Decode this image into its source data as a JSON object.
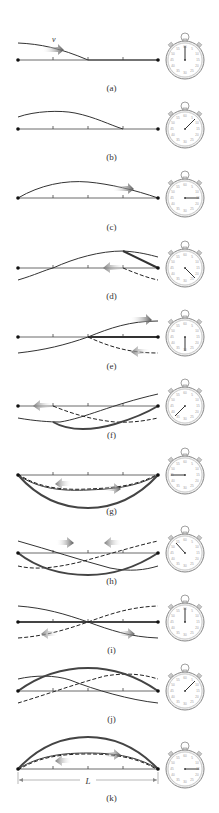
{
  "figure": {
    "velocity_label": "v",
    "length_label": "L",
    "colors": {
      "string": "#3a3a3a",
      "resultant": "#555555",
      "arrow_light": "#b0b0b0",
      "arrow_dark": "#5a5a5a"
    },
    "panels": [
      {
        "id": "a",
        "label": "(a)",
        "stopwatch_hand_deg": 0
      },
      {
        "id": "b",
        "label": "(b)",
        "stopwatch_hand_deg": 45
      },
      {
        "id": "c",
        "label": "(c)",
        "stopwatch_hand_deg": 90
      },
      {
        "id": "d",
        "label": "(d)",
        "stopwatch_hand_deg": 135
      },
      {
        "id": "e",
        "label": "(e)",
        "stopwatch_hand_deg": 180
      },
      {
        "id": "f",
        "label": "(f)",
        "stopwatch_hand_deg": 225
      },
      {
        "id": "g",
        "label": "(g)",
        "stopwatch_hand_deg": 270
      },
      {
        "id": "h",
        "label": "(h)",
        "stopwatch_hand_deg": 315
      },
      {
        "id": "i",
        "label": "(i)",
        "stopwatch_hand_deg": 0
      },
      {
        "id": "j",
        "label": "(j)",
        "stopwatch_hand_deg": 45
      },
      {
        "id": "k",
        "label": "(k)",
        "stopwatch_hand_deg": 90
      }
    ]
  }
}
